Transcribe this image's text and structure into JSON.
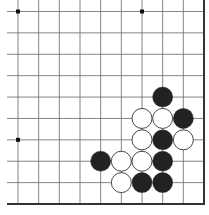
{
  "board": {
    "type": "go-board-fragment",
    "columns": 10,
    "rows": 10,
    "edges": [
      "right",
      "bottom"
    ],
    "star_points": [
      {
        "col": 0,
        "row": 0
      },
      {
        "col": 6,
        "row": 0
      },
      {
        "col": 0,
        "row": 6
      }
    ],
    "stones": [
      {
        "color": "black",
        "col": 7,
        "row": 4
      },
      {
        "color": "white",
        "col": 6,
        "row": 5
      },
      {
        "color": "white",
        "col": 7,
        "row": 5
      },
      {
        "color": "black",
        "col": 8,
        "row": 5
      },
      {
        "color": "white",
        "col": 6,
        "row": 6
      },
      {
        "color": "black",
        "col": 7,
        "row": 6
      },
      {
        "color": "white",
        "col": 8,
        "row": 6
      },
      {
        "color": "black",
        "col": 4,
        "row": 7
      },
      {
        "color": "white",
        "col": 5,
        "row": 7
      },
      {
        "color": "white",
        "col": 6,
        "row": 7
      },
      {
        "color": "black",
        "col": 7,
        "row": 7
      },
      {
        "color": "white",
        "col": 5,
        "row": 8
      },
      {
        "color": "black",
        "col": 6,
        "row": 8
      },
      {
        "color": "black",
        "col": 7,
        "row": 8
      }
    ],
    "colors": {
      "line": "#777777",
      "edge": "#333333",
      "black_stone": "#222222",
      "white_stone": "#ffffff",
      "white_stone_outline": "#333333",
      "background": "#ffffff"
    }
  }
}
